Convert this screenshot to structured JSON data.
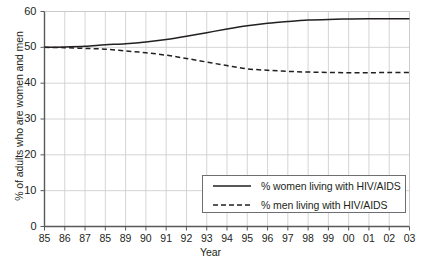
{
  "chart_data": {
    "type": "line",
    "title": "",
    "xlabel": "Year",
    "ylabel": "% of adults who are women and men",
    "categories": [
      "85",
      "86",
      "87",
      "85",
      "89",
      "90",
      "91",
      "92",
      "93",
      "94",
      "95",
      "96",
      "97",
      "98",
      "99",
      "00",
      "01",
      "02",
      "03"
    ],
    "xlim": [
      0,
      18
    ],
    "ylim": [
      0,
      60
    ],
    "yticks": [
      0,
      10,
      20,
      30,
      40,
      50,
      60
    ],
    "ytick_labels": [
      "0",
      "10",
      "20",
      "30",
      "40",
      "50",
      "60"
    ],
    "grid": true,
    "legend_position": "lower right",
    "series": [
      {
        "name": "% women living with HIV/AIDS",
        "style": "solid",
        "color": "#231f20",
        "values": [
          50.0,
          50.1,
          50.3,
          50.7,
          51.0,
          51.5,
          52.2,
          53.1,
          54.1,
          55.1,
          56.0,
          56.7,
          57.2,
          57.6,
          57.8,
          57.9,
          58.0,
          58.0,
          58.0
        ]
      },
      {
        "name": "% men living with HIV/AIDS",
        "style": "dashed",
        "color": "#231f20",
        "values": [
          50.0,
          49.9,
          49.7,
          49.5,
          49.0,
          48.5,
          47.8,
          46.9,
          45.9,
          44.9,
          44.0,
          43.6,
          43.3,
          43.1,
          43.0,
          42.9,
          42.9,
          43.0,
          43.0
        ]
      }
    ]
  },
  "legend": {
    "items": [
      {
        "label": "% women living with HIV/AIDS",
        "style": "solid"
      },
      {
        "label": "% men living with HIV/AIDS",
        "style": "dashed"
      }
    ]
  },
  "colors": {
    "line": "#231f20",
    "grid": "#c9c9c9",
    "axis": "#58595b",
    "legend_border": "#6d6e71",
    "background": "#ffffff"
  }
}
